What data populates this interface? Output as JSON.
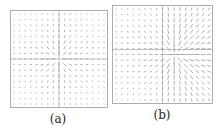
{
  "chart_data": [
    {
      "type": "quiver",
      "title": "",
      "label": "(a)",
      "xlabel": "",
      "ylabel": "",
      "grid_size": 17,
      "field": "radial-sink",
      "center": [
        0.5,
        0.5
      ],
      "crosshair": [
        0.5,
        0.5
      ],
      "description": "Vector field with arrows pointing toward a single central point; arrow length largest near center and fading outward"
    },
    {
      "type": "quiver",
      "title": "",
      "label": "(b)",
      "xlabel": "",
      "ylabel": "",
      "grid_size": 17,
      "field": "offset-sink",
      "center": [
        0.62,
        0.5
      ],
      "crosshair": [
        0.5,
        0.45
      ],
      "description": "Vector field with arrows converging toward a point right of center; long diagonal arrows in upper-right and lower-right regions"
    }
  ],
  "captions": {
    "a": "(a)",
    "b": "(b)"
  },
  "colors": {
    "frame": "#9a9a9a",
    "arrow": "#7a7a7a",
    "crosshair": "#8a8a8a",
    "text": "#222222"
  }
}
